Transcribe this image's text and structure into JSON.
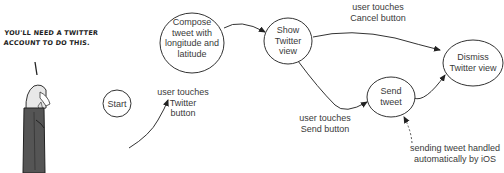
{
  "cartoon": {
    "caption_line1": "YOU'LL NEED A TWITTER",
    "caption_line2": "ACCOUNT TO DO THIS."
  },
  "nodes": {
    "start": "Start",
    "compose": [
      "Compose",
      "tweet with",
      "longitude and",
      "latitude"
    ],
    "show": [
      "Show",
      "Twitter",
      "view"
    ],
    "send": [
      "Send",
      "tweet"
    ],
    "dismiss": [
      "Dismiss",
      "Twitter view"
    ]
  },
  "edges": {
    "start_to_compose": [
      "user touches",
      "Twitter",
      "button"
    ],
    "show_to_dismiss": [
      "user touches",
      "Cancel button"
    ],
    "show_to_send": [
      "user touches",
      "Send button"
    ],
    "auto_note": [
      "sending tweet handled",
      "automatically by iOS"
    ]
  }
}
